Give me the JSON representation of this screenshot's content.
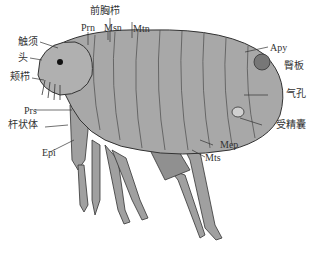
{
  "diagram": {
    "colors": {
      "body": "#a8a8a8",
      "body_dark": "#7a7a7a",
      "outline": "#333333",
      "leader": "#333333",
      "background": "#ffffff"
    },
    "labels": {
      "pronotal_comb": "前胸栉",
      "prn": "Prn",
      "msn": "Msn",
      "mtn": "Mtn",
      "antenna": "触须",
      "head": "头",
      "genal_comb": "颊栉",
      "prs": "Prs",
      "rod_body": "杆状体",
      "epi": "Epi",
      "apy": "Apy",
      "sensilium": "臀板",
      "spiracle": "气孔",
      "spermatheca": "受精囊",
      "mep": "Mep",
      "mts": "Mts"
    }
  }
}
